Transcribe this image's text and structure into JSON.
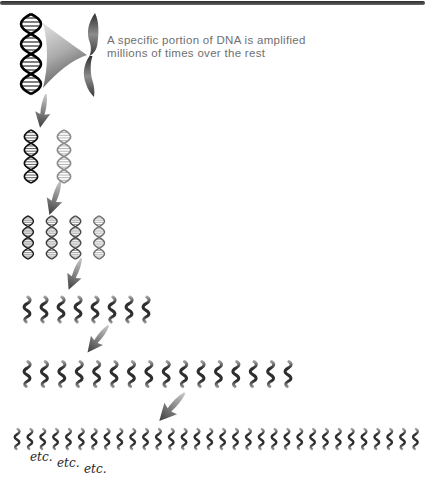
{
  "page": {
    "background": "#ffffff",
    "top_bar_color": "#3f3f3f"
  },
  "caption": {
    "line1": "A specific portion of DNA is amplified",
    "line2": "millions of times over the rest",
    "color": "#6f6f6f"
  },
  "etc_labels": [
    "etc.",
    "etc.",
    "etc."
  ],
  "diagram": {
    "rows": [
      {
        "count": 1
      },
      {
        "count": 2
      },
      {
        "count": 4
      },
      {
        "count": 8
      },
      {
        "count": 16
      },
      {
        "count": 32
      }
    ],
    "row2_strand_colors": [
      "#0f0f0f",
      "#8d8d8d"
    ],
    "row3_strand_colors": [
      "#1c1c1c",
      "#3f3f3f",
      "#4a4a4a",
      "#6e6e6e"
    ],
    "squiggle_dark": "#2e2e2e",
    "squiggle_light": "#ababab",
    "arrow_dark": "#3d3d3d",
    "arrow_light": "#c9c9c9",
    "helix_color": "#000000"
  }
}
